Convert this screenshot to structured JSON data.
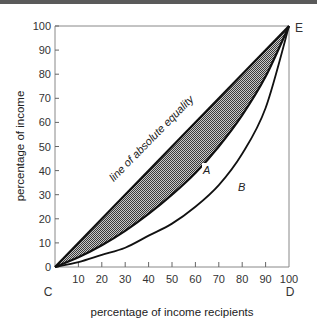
{
  "chart_data": {
    "type": "line",
    "title": "",
    "xlabel": "percentage of income recipients",
    "ylabel": "percentage of income",
    "xlim": [
      0,
      100
    ],
    "ylim": [
      0,
      100
    ],
    "grid": false,
    "x_ticks": [
      10,
      20,
      30,
      40,
      50,
      60,
      70,
      80,
      90,
      100
    ],
    "y_ticks": [
      0,
      10,
      20,
      30,
      40,
      50,
      60,
      70,
      80,
      90,
      100
    ],
    "x": [
      0,
      10,
      20,
      30,
      40,
      50,
      60,
      70,
      80,
      90,
      100
    ],
    "series": [
      {
        "name": "line of absolute equality",
        "values": [
          0,
          10,
          20,
          30,
          40,
          50,
          60,
          70,
          80,
          90,
          100
        ]
      },
      {
        "name": "A",
        "values": [
          0,
          4,
          9,
          15,
          22,
          30,
          39,
          50,
          63,
          79,
          100
        ]
      },
      {
        "name": "B",
        "values": [
          0,
          2,
          5,
          8,
          13,
          18,
          25,
          34,
          47,
          66,
          100
        ]
      }
    ],
    "shaded_region": "between line of absolute equality and curve A",
    "annotations": [
      "line of absolute equality",
      "A",
      "B",
      "C",
      "D",
      "E"
    ],
    "corner_labels": {
      "origin": "C",
      "bottom_right": "D",
      "top_right": "E"
    }
  },
  "labels": {
    "ylabel": "percentage of income",
    "xlabel": "percentage of income recipients",
    "equality": "line of absolute equality",
    "curve_a": "A",
    "curve_b": "B",
    "c": "C",
    "d": "D",
    "e": "E"
  },
  "y_tick_labels": [
    "0",
    "10",
    "20",
    "30",
    "40",
    "50",
    "60",
    "70",
    "80",
    "90",
    "100"
  ],
  "x_tick_labels": [
    "10",
    "20",
    "30",
    "40",
    "50",
    "60",
    "70",
    "80",
    "90",
    "100"
  ]
}
